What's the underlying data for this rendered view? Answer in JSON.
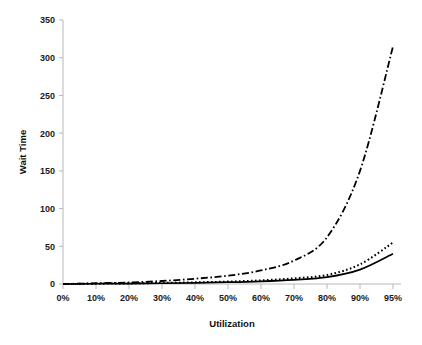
{
  "chart_data": {
    "type": "line",
    "title": "",
    "xlabel": "Utilization",
    "ylabel": "Wait Time",
    "categories": [
      "0%",
      "10%",
      "20%",
      "30%",
      "40%",
      "50%",
      "60%",
      "70%",
      "80%",
      "90%",
      "95%"
    ],
    "x_tick_labels": [
      "0%",
      "10%",
      "20%",
      "30%",
      "40%",
      "50%",
      "60%",
      "70%",
      "80%",
      "90%",
      "95%"
    ],
    "y_tick_labels": [
      "0",
      "50",
      "100",
      "150",
      "200",
      "250",
      "300",
      "350"
    ],
    "y_ticks": [
      0,
      50,
      100,
      150,
      200,
      250,
      300,
      350
    ],
    "ylim": [
      0,
      350
    ],
    "grid": false,
    "legend": "none",
    "axis_color": "#b8b8b8",
    "line_color": "#000000",
    "series": [
      {
        "name": "series-dash-dot",
        "style": "dashdot",
        "values": [
          0,
          1,
          2,
          4,
          7,
          11,
          18,
          31,
          62,
          150,
          315
        ]
      },
      {
        "name": "series-dotted",
        "style": "dotted",
        "values": [
          0,
          0.4,
          0.8,
          1.4,
          2.2,
          3.2,
          4.8,
          7.5,
          12,
          26,
          55
        ]
      },
      {
        "name": "series-solid",
        "style": "solid",
        "values": [
          0,
          0.3,
          0.6,
          1.0,
          1.6,
          2.4,
          3.6,
          5.6,
          9,
          19,
          40
        ]
      }
    ]
  },
  "axes": {
    "x_title": "Utilization",
    "y_title": "Wait Time"
  }
}
